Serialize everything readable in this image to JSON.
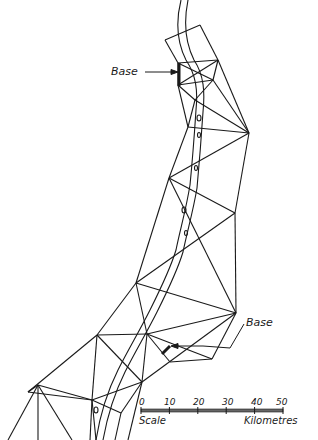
{
  "diagram": {
    "labels": {
      "base_top": "Base",
      "base_bottom": "Base",
      "scale": "Scale",
      "units": "Kilometres"
    },
    "scale_ticks": [
      "0",
      "10",
      "20",
      "30",
      "40",
      "50"
    ],
    "colors": {
      "ink": "#1a1a1a",
      "background": "#ffffff"
    },
    "stations": {
      "A": [
        200,
        25
      ],
      "B": [
        165,
        40
      ],
      "C": [
        178,
        63
      ],
      "D": [
        218,
        60
      ],
      "E": [
        178,
        85
      ],
      "F": [
        213,
        80
      ],
      "G": [
        195,
        100
      ],
      "H": [
        188,
        127
      ],
      "I": [
        249,
        133
      ],
      "J": [
        169,
        178
      ],
      "K": [
        235,
        213
      ],
      "L": [
        136,
        283
      ],
      "M": [
        236,
        313
      ],
      "N": [
        147,
        334
      ],
      "O": [
        170,
        362
      ],
      "P": [
        212,
        359
      ],
      "Q": [
        97,
        335
      ],
      "R": [
        28,
        392
      ],
      "S": [
        142,
        382
      ],
      "T": [
        92,
        400
      ],
      "U": [
        121,
        413
      ],
      "V": [
        38,
        385
      ]
    },
    "edges": [
      [
        "B",
        "A"
      ],
      [
        "A",
        "D"
      ],
      [
        "B",
        "C"
      ],
      [
        "D",
        "I"
      ],
      [
        "C",
        "D"
      ],
      [
        "C",
        "E"
      ],
      [
        "D",
        "F"
      ],
      [
        "E",
        "F"
      ],
      [
        "C",
        "F"
      ],
      [
        "E",
        "D"
      ],
      [
        "E",
        "G"
      ],
      [
        "F",
        "G"
      ],
      [
        "E",
        "H"
      ],
      [
        "F",
        "I"
      ],
      [
        "G",
        "I"
      ],
      [
        "G",
        "H"
      ],
      [
        "H",
        "I"
      ],
      [
        "H",
        "J"
      ],
      [
        "I",
        "J"
      ],
      [
        "I",
        "K"
      ],
      [
        "J",
        "K"
      ],
      [
        "J",
        "L"
      ],
      [
        "K",
        "L"
      ],
      [
        "K",
        "M"
      ],
      [
        "L",
        "M"
      ],
      [
        "J",
        "M"
      ],
      [
        "L",
        "N"
      ],
      [
        "M",
        "N"
      ],
      [
        "N",
        "O"
      ],
      [
        "N",
        "P"
      ],
      [
        "M",
        "P"
      ],
      [
        "O",
        "P"
      ],
      [
        "N",
        "S"
      ],
      [
        "L",
        "Q"
      ],
      [
        "Q",
        "N"
      ],
      [
        "Q",
        "S"
      ],
      [
        "Q",
        "R"
      ],
      [
        "R",
        "V"
      ],
      [
        "Q",
        "T"
      ],
      [
        "T",
        "S"
      ],
      [
        "T",
        "U"
      ],
      [
        "S",
        "U"
      ],
      [
        "M",
        "S"
      ],
      [
        "V",
        "T"
      ],
      [
        "R",
        "T"
      ]
    ],
    "open_edges": [
      [
        "V",
        [
          8,
          440
        ]
      ],
      [
        "V",
        [
          38,
          440
        ]
      ],
      [
        "V",
        [
          72,
          440
        ]
      ],
      [
        "T",
        [
          90,
          440
        ]
      ],
      [
        "T",
        [
          96,
          440
        ]
      ],
      [
        "U",
        [
          115,
          440
        ]
      ],
      [
        "S",
        [
          128,
          440
        ]
      ]
    ]
  }
}
